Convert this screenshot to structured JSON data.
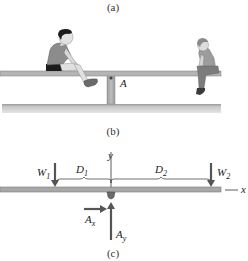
{
  "figure": {
    "captions": {
      "a": "(a)",
      "b": "(b)",
      "c": "(c)"
    },
    "scene": {
      "description": "Two children on a seesaw pivoted at point A",
      "pivot_label": "A",
      "left_child": "boy seated on left end of seesaw",
      "right_child": "small child seated on right end of seesaw"
    },
    "free_body_diagram": {
      "axes": {
        "x_label": "x",
        "y_label": "y"
      },
      "forces": [
        {
          "name": "W",
          "sub": "1",
          "direction": "down",
          "position": "left end"
        },
        {
          "name": "W",
          "sub": "2",
          "direction": "down",
          "position": "right end"
        },
        {
          "name": "A",
          "sub": "x",
          "direction": "right",
          "position": "pivot"
        },
        {
          "name": "A",
          "sub": "y",
          "direction": "up",
          "position": "pivot"
        }
      ],
      "distances": [
        {
          "name": "D",
          "sub": "1",
          "from": "W1",
          "to": "pivot"
        },
        {
          "name": "D",
          "sub": "2",
          "from": "pivot",
          "to": "W2"
        }
      ]
    },
    "colors": {
      "board": "#a8a8a8",
      "board_edge": "#7a7a7a",
      "ground": "#c4c4c4",
      "arrow": "#5a5a5a",
      "text": "#222222"
    }
  }
}
